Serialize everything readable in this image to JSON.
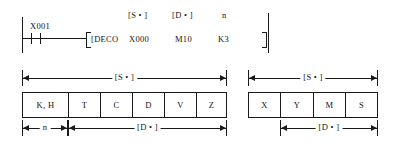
{
  "diagram": {
    "ink_color": "#1a1a1a",
    "background_color": "#ffffff"
  },
  "ladder": {
    "input_contact_label": "X001",
    "instruction": "[DECO",
    "closing_bracket": "]",
    "operands": [
      {
        "header": "[S • ]",
        "value": "X000"
      },
      {
        "header": "[D • ]",
        "value": "M10"
      },
      {
        "header": "n",
        "value": "K3"
      }
    ]
  },
  "tables": [
    {
      "id": "table-left",
      "cells": [
        "K, H",
        "T",
        "C",
        "D",
        "V",
        "Z"
      ],
      "top_dimension": {
        "label": "[S • ]",
        "span": "all"
      },
      "bottom_dimensions": [
        {
          "label": "n",
          "span": "cell-1"
        },
        {
          "label": "[D • ]",
          "span": "cells-2-6"
        }
      ]
    },
    {
      "id": "table-right",
      "cells": [
        "X",
        "Y",
        "M",
        "S"
      ],
      "top_dimension": {
        "label": "[S • ]",
        "span": "all"
      },
      "bottom_dimensions": [
        {
          "label": "[D • ]",
          "span": "cells-2-4"
        }
      ]
    }
  ]
}
